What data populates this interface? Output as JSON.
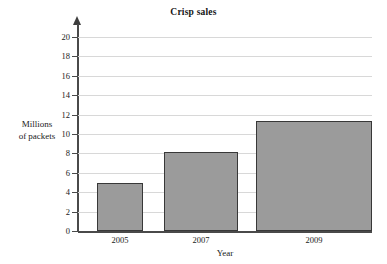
{
  "chart_data": {
    "type": "bar",
    "title": "Crisp sales",
    "xlabel": "Year",
    "ylabel_line1": "Millions",
    "ylabel_line2": "of packets",
    "categories": [
      "2005",
      "2007",
      "2009"
    ],
    "values": [
      5.0,
      8.1,
      11.3
    ],
    "ylim": [
      0,
      20
    ],
    "ytick_step": 2,
    "yticks": [
      "0",
      "2",
      "4",
      "6",
      "8",
      "10",
      "12",
      "14",
      "16",
      "18",
      "20"
    ],
    "grid": "horizontal",
    "legend": "none",
    "bar_fill_color": "#9b9b9b",
    "bar_edge_color": "#383838",
    "gridline_color": "#d8d8d8",
    "axis_color": "#4a4a4a",
    "background_color": "#ffffff"
  }
}
